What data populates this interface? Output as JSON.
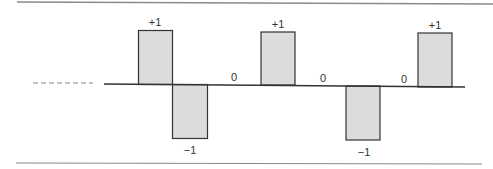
{
  "diagram": {
    "title": "",
    "colors": {
      "bar_fill": "#dcdcdc",
      "bar_stroke": "#333333",
      "axis": "#333333",
      "rule": "#8a8a8a",
      "dash": "#888888"
    },
    "pulses": [
      {
        "value": "+1",
        "kind": "positive"
      },
      {
        "value": "−1",
        "kind": "negative"
      },
      {
        "value": "0",
        "kind": "zero"
      },
      {
        "value": "+1",
        "kind": "positive"
      },
      {
        "value": "0",
        "kind": "zero"
      },
      {
        "value": "−1",
        "kind": "negative"
      },
      {
        "value": "0",
        "kind": "zero"
      },
      {
        "value": "+1",
        "kind": "positive"
      }
    ],
    "labels": {
      "p1": "+1",
      "p2": "−1",
      "z1": "0",
      "p3": "+1",
      "z2": "0",
      "p4": "−1",
      "z3": "0",
      "p5": "+1"
    }
  }
}
